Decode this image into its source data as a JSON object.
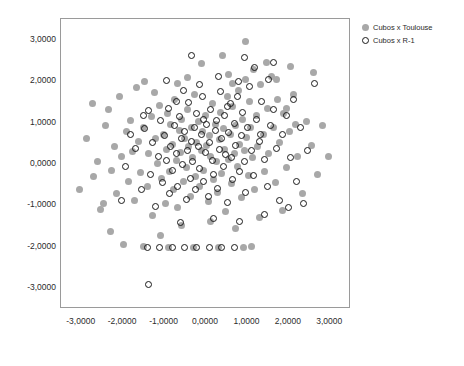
{
  "chart_data": {
    "type": "scatter",
    "title": "",
    "xlabel": "",
    "ylabel": "",
    "xlim": [
      -3.5,
      3.5
    ],
    "ylim": [
      -3.5,
      3.5
    ],
    "grid": false,
    "legend_position": "top-right",
    "xticks": [
      "-3,0000",
      "-2,0000",
      "-1,0000",
      "0,0000",
      "1,0000",
      "2,0000",
      "3,0000"
    ],
    "xtick_values": [
      -3,
      -2,
      -1,
      0,
      1,
      2,
      3
    ],
    "yticks": [
      "3,0000",
      "2,0000",
      "1,0000",
      "0,0000",
      "-1,0000",
      "-2,0000",
      "-3,0000"
    ],
    "ytick_values": [
      3,
      2,
      1,
      0,
      -1,
      -2,
      -3
    ],
    "series": [
      {
        "name": "Cubos x Toulouse",
        "marker": "filled-circle",
        "color": "#a8a8a8",
        "points": [
          [
            -3.05,
            -0.62
          ],
          [
            -2.88,
            0.62
          ],
          [
            -2.72,
            -0.3
          ],
          [
            -2.62,
            0.05
          ],
          [
            -2.55,
            -1.1
          ],
          [
            -2.42,
            0.92
          ],
          [
            -2.35,
            1.32
          ],
          [
            -2.28,
            -0.15
          ],
          [
            -2.2,
            0.42
          ],
          [
            -2.15,
            -0.72
          ],
          [
            -2.1,
            1.62
          ],
          [
            -2.05,
            0.18
          ],
          [
            -1.98,
            -1.95
          ],
          [
            -1.92,
            0.78
          ],
          [
            -1.88,
            -0.42
          ],
          [
            -1.82,
            1.05
          ],
          [
            -1.78,
            0.3
          ],
          [
            -1.72,
            -0.88
          ],
          [
            -1.68,
            1.85
          ],
          [
            -1.62,
            0.55
          ],
          [
            -1.58,
            -0.2
          ],
          [
            -1.52,
            0.88
          ],
          [
            -1.48,
            2.0
          ],
          [
            -1.42,
            -0.55
          ],
          [
            -1.38,
            0.25
          ],
          [
            -1.32,
            1.15
          ],
          [
            -1.28,
            -1.25
          ],
          [
            -1.22,
            0.62
          ],
          [
            -1.18,
            0.02
          ],
          [
            -1.12,
            1.42
          ],
          [
            -1.08,
            -0.35
          ],
          [
            -1.02,
            0.72
          ],
          [
            -0.98,
            -0.95
          ],
          [
            -0.95,
            0.35
          ],
          [
            -0.92,
            1.22
          ],
          [
            -0.88,
            -0.18
          ],
          [
            -0.85,
            0.95
          ],
          [
            -0.82,
            0.48
          ],
          [
            -0.78,
            -0.62
          ],
          [
            -0.75,
            1.55
          ],
          [
            -0.72,
            0.08
          ],
          [
            -0.68,
            -1.05
          ],
          [
            -0.65,
            0.82
          ],
          [
            -0.62,
            0.28
          ],
          [
            -0.58,
            1.08
          ],
          [
            -0.55,
            -0.42
          ],
          [
            -0.52,
            0.62
          ],
          [
            -0.48,
            -0.08
          ],
          [
            -0.45,
            1.32
          ],
          [
            -0.42,
            0.42
          ],
          [
            -0.38,
            -0.78
          ],
          [
            -0.35,
            0.88
          ],
          [
            -0.32,
            0.15
          ],
          [
            -0.28,
            1.68
          ],
          [
            -0.25,
            -0.3
          ],
          [
            -0.22,
            0.52
          ],
          [
            -0.18,
            1.02
          ],
          [
            -0.15,
            -0.55
          ],
          [
            -0.12,
            0.32
          ],
          [
            -0.08,
            0.78
          ],
          [
            -0.05,
            -0.15
          ],
          [
            -0.02,
            1.18
          ],
          [
            0.02,
            0.45
          ],
          [
            0.05,
            -0.9
          ],
          [
            0.08,
            0.68
          ],
          [
            0.12,
            0.18
          ],
          [
            0.15,
            1.45
          ],
          [
            0.18,
            -0.38
          ],
          [
            0.22,
            0.95
          ],
          [
            0.25,
            0.05
          ],
          [
            0.28,
            -0.68
          ],
          [
            0.32,
            0.58
          ],
          [
            0.35,
            1.25
          ],
          [
            0.38,
            -0.22
          ],
          [
            0.42,
            0.85
          ],
          [
            0.45,
            0.35
          ],
          [
            0.48,
            -1.15
          ],
          [
            0.52,
            1.62
          ],
          [
            0.55,
            0.12
          ],
          [
            0.58,
            0.72
          ],
          [
            0.62,
            -0.48
          ],
          [
            0.65,
            1.38
          ],
          [
            0.68,
            0.25
          ],
          [
            0.72,
            0.92
          ],
          [
            0.75,
            -0.05
          ],
          [
            0.78,
            1.78
          ],
          [
            0.82,
            0.48
          ],
          [
            0.85,
            -0.82
          ],
          [
            0.88,
            1.08
          ],
          [
            0.92,
            0.32
          ],
          [
            0.95,
            2.05
          ],
          [
            0.98,
            0.65
          ],
          [
            1.02,
            -0.28
          ],
          [
            1.05,
            1.52
          ],
          [
            1.08,
            0.88
          ],
          [
            1.12,
            0.15
          ],
          [
            1.15,
            2.28
          ],
          [
            1.18,
            -0.62
          ],
          [
            1.22,
            1.18
          ],
          [
            1.25,
            0.42
          ],
          [
            1.32,
            1.92
          ],
          [
            1.38,
            0.72
          ],
          [
            1.42,
            -0.18
          ],
          [
            1.48,
            1.35
          ],
          [
            1.52,
            0.25
          ],
          [
            1.58,
            2.12
          ],
          [
            1.62,
            0.88
          ],
          [
            1.68,
            -0.45
          ],
          [
            1.72,
            1.55
          ],
          [
            1.78,
            0.52
          ],
          [
            1.88,
            1.22
          ],
          [
            1.95,
            -0.08
          ],
          [
            2.02,
            0.78
          ],
          [
            2.12,
            1.68
          ],
          [
            2.22,
            0.18
          ],
          [
            2.32,
            -0.72
          ],
          [
            2.42,
            1.02
          ],
          [
            2.55,
            0.45
          ],
          [
            2.68,
            -0.25
          ],
          [
            2.82,
            0.92
          ],
          [
            2.95,
            0.18
          ],
          [
            -2.3,
            -1.62
          ],
          [
            -1.1,
            -1.72
          ],
          [
            -0.6,
            -1.48
          ],
          [
            0.1,
            -1.38
          ],
          [
            0.7,
            -1.55
          ],
          [
            1.3,
            -1.28
          ],
          [
            1.85,
            -1.12
          ],
          [
            -0.9,
            -2.02
          ],
          [
            -0.3,
            -2.02
          ],
          [
            0.3,
            -2.02
          ],
          [
            0.9,
            -2.02
          ],
          [
            1.1,
            -1.98
          ],
          [
            -1.5,
            -2.0
          ],
          [
            2.05,
            2.35
          ],
          [
            1.45,
            2.45
          ],
          [
            0.95,
            2.95
          ],
          [
            0.55,
            2.15
          ],
          [
            -0.1,
            2.42
          ],
          [
            -0.7,
            1.95
          ],
          [
            2.6,
            2.22
          ],
          [
            1.7,
            2.05
          ],
          [
            -2.75,
            1.45
          ],
          [
            -2.48,
            -0.95
          ],
          [
            0.4,
            2.62
          ],
          [
            1.95,
            1.35
          ],
          [
            2.15,
            0.95
          ],
          [
            0.65,
            1.95
          ],
          [
            -0.45,
            2.08
          ],
          [
            -1.25,
            1.72
          ]
        ]
      },
      {
        "name": "Cubos x R-1",
        "marker": "open-circle",
        "color": "#1a1a1a",
        "points": [
          [
            -1.95,
            -0.05
          ],
          [
            -1.7,
            0.38
          ],
          [
            -1.55,
            -0.62
          ],
          [
            -1.48,
            0.85
          ],
          [
            -1.4,
            1.28
          ],
          [
            -1.35,
            -0.25
          ],
          [
            -1.28,
            0.52
          ],
          [
            -1.22,
            -1.02
          ],
          [
            -1.15,
            0.18
          ],
          [
            -1.1,
            1.05
          ],
          [
            -1.05,
            -0.45
          ],
          [
            -1.0,
            0.68
          ],
          [
            -0.95,
            0.08
          ],
          [
            -0.9,
            1.35
          ],
          [
            -0.88,
            -0.72
          ],
          [
            -0.85,
            0.42
          ],
          [
            -0.8,
            -0.15
          ],
          [
            -0.76,
            0.92
          ],
          [
            -0.72,
            0.25
          ],
          [
            -0.68,
            -0.55
          ],
          [
            -0.64,
            1.15
          ],
          [
            -0.6,
            0.62
          ],
          [
            -0.56,
            -0.02
          ],
          [
            -0.52,
            0.78
          ],
          [
            -0.48,
            -0.85
          ],
          [
            -0.45,
            0.32
          ],
          [
            -0.42,
            1.48
          ],
          [
            -0.38,
            -0.35
          ],
          [
            -0.35,
            0.55
          ],
          [
            -0.32,
            0.05
          ],
          [
            -0.28,
            0.88
          ],
          [
            -0.25,
            -0.62
          ],
          [
            -0.22,
            1.22
          ],
          [
            -0.18,
            0.42
          ],
          [
            -0.15,
            -0.12
          ],
          [
            -0.12,
            0.72
          ],
          [
            -0.08,
            1.62
          ],
          [
            -0.05,
            -0.42
          ],
          [
            -0.02,
            0.28
          ],
          [
            0.02,
            0.95
          ],
          [
            0.05,
            -0.78
          ],
          [
            0.08,
            0.52
          ],
          [
            0.12,
            1.32
          ],
          [
            0.15,
            0.08
          ],
          [
            0.18,
            -0.25
          ],
          [
            0.22,
            0.82
          ],
          [
            0.25,
            1.05
          ],
          [
            0.28,
            -0.58
          ],
          [
            0.32,
            0.35
          ],
          [
            0.35,
            1.75
          ],
          [
            0.38,
            0.62
          ],
          [
            0.42,
            -0.05
          ],
          [
            0.45,
            1.18
          ],
          [
            0.48,
            0.22
          ],
          [
            0.52,
            -0.92
          ],
          [
            0.55,
            0.75
          ],
          [
            0.58,
            1.45
          ],
          [
            0.62,
            0.15
          ],
          [
            0.65,
            -0.38
          ],
          [
            0.68,
            0.98
          ],
          [
            0.72,
            0.45
          ],
          [
            0.76,
            1.62
          ],
          [
            0.8,
            -0.18
          ],
          [
            0.85,
            0.68
          ],
          [
            0.88,
            1.25
          ],
          [
            0.92,
            0.05
          ],
          [
            0.95,
            -0.68
          ],
          [
            1.0,
            0.88
          ],
          [
            1.05,
            1.88
          ],
          [
            1.1,
            0.32
          ],
          [
            1.15,
            -0.28
          ],
          [
            1.22,
            1.08
          ],
          [
            1.28,
            0.55
          ],
          [
            1.35,
            1.52
          ],
          [
            1.42,
            0.12
          ],
          [
            1.48,
            -0.55
          ],
          [
            1.55,
            0.92
          ],
          [
            1.62,
            1.32
          ],
          [
            1.7,
            0.38
          ],
          [
            1.78,
            -0.88
          ],
          [
            1.85,
            0.72
          ],
          [
            1.95,
            1.18
          ],
          [
            2.05,
            0.15
          ],
          [
            2.18,
            -0.42
          ],
          [
            2.28,
            0.88
          ],
          [
            2.45,
            0.32
          ],
          [
            2.62,
            1.95
          ],
          [
            1.5,
            2.05
          ],
          [
            1.18,
            2.32
          ],
          [
            0.78,
            1.98
          ],
          [
            0.3,
            2.12
          ],
          [
            -0.15,
            1.92
          ],
          [
            -0.55,
            1.78
          ],
          [
            -0.95,
            2.02
          ],
          [
            -1.52,
            1.18
          ],
          [
            -1.82,
            0.72
          ],
          [
            -2.05,
            -0.88
          ],
          [
            -1.42,
            -2.02
          ],
          [
            -1.12,
            -2.02
          ],
          [
            -0.82,
            -2.02
          ],
          [
            -0.52,
            -2.02
          ],
          [
            -0.22,
            -2.02
          ],
          [
            0.08,
            -2.02
          ],
          [
            0.38,
            -2.02
          ],
          [
            0.68,
            -2.02
          ],
          [
            -1.38,
            -2.92
          ],
          [
            -0.62,
            -1.42
          ],
          [
            0.18,
            -1.32
          ],
          [
            0.82,
            -1.38
          ],
          [
            1.42,
            -1.22
          ],
          [
            1.98,
            -1.05
          ],
          [
            2.35,
            -0.95
          ],
          [
            1.62,
            2.45
          ],
          [
            0.92,
            2.58
          ],
          [
            -0.35,
            2.62
          ],
          [
            2.12,
            1.55
          ],
          [
            0.52,
            1.38
          ],
          [
            -0.72,
            1.52
          ],
          [
            1.32,
            0.72
          ],
          [
            -0.05,
            1.08
          ]
        ]
      }
    ]
  }
}
